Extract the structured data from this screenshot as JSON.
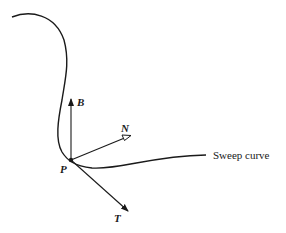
{
  "diagram": {
    "labels": {
      "point": "P",
      "binormal": "B",
      "normal": "N",
      "tangent": "T",
      "curve_caption": "Sweep curve"
    },
    "colors": {
      "ink": "#1a1a1a",
      "background": "#ffffff"
    }
  }
}
